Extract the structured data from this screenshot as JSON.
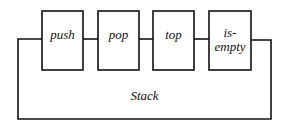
{
  "diagram": {
    "container_label": "Stack",
    "operations": [
      {
        "label": "push"
      },
      {
        "label": "pop"
      },
      {
        "label": "top"
      },
      {
        "label": "is-\nempty",
        "line1": "is-",
        "line2": "empty"
      }
    ]
  }
}
